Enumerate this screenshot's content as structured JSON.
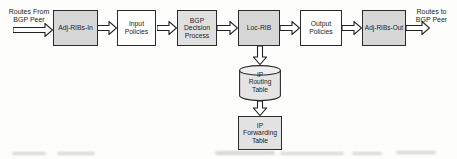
{
  "diagram": {
    "type": "flowchart",
    "outer_labels": {
      "routes_from": "Routes From\nBGP Peer",
      "routes_to": "Routes to\nBGP Peer"
    },
    "nodes": {
      "adj_ribs_in": {
        "label": "Adj-RIBs-In",
        "shape": "rect",
        "fill": "#d7d7d7"
      },
      "input_policies": {
        "label": "Input\nPolicies",
        "shape": "rect",
        "fill": "#ffffff"
      },
      "bgp_decision": {
        "label": "BGP\nDecision\nProcess",
        "shape": "rect",
        "fill": "#e0e0e0"
      },
      "loc_rib": {
        "label": "Loc-RIB",
        "shape": "rect",
        "fill": "#d7d7d7"
      },
      "output_policies": {
        "label": "Output\nPolicies",
        "shape": "rect",
        "fill": "#ffffff"
      },
      "adj_ribs_out": {
        "label": "Adj-RIBs-Out",
        "shape": "rect",
        "fill": "#d7d7d7"
      },
      "ip_routing_table": {
        "label": "IP\nRouting\nTable",
        "shape": "cylinder",
        "fill": "#e4e4e4"
      },
      "ip_forwarding_table": {
        "label": "IP\nForwarding\nTable",
        "shape": "rect",
        "fill": "#e2e2e2"
      }
    },
    "main_flow": [
      "Routes From BGP Peer",
      "Adj-RIBs-In",
      "Input Policies",
      "BGP Decision Process",
      "Loc-RIB",
      "Output Policies",
      "Adj-RIBs-Out",
      "Routes to BGP Peer"
    ],
    "branch_flow": [
      "Loc-RIB",
      "IP Routing Table",
      "IP Forwarding Table"
    ],
    "colors": {
      "background": "#fdfdfc",
      "border": "#2a2a2a",
      "text": "#1d1d1d",
      "shaded_box": "#d7d7d7",
      "light_box": "#e0e0e0",
      "white_box": "#ffffff",
      "arrow_fill": "#ffffff",
      "arrow_stroke": "#222222"
    }
  }
}
